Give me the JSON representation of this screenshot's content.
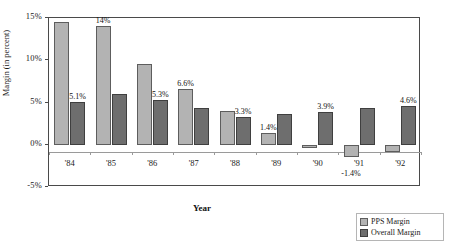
{
  "chart_data": {
    "type": "bar",
    "title": "",
    "xlabel": "Year",
    "ylabel": "Margin (in percent)",
    "categories": [
      "'84",
      "'85",
      "'86",
      "'87",
      "'88",
      "'89",
      "'90",
      "'91",
      "'92"
    ],
    "series": [
      {
        "name": "PPS Margin",
        "color": "#b3b3b3",
        "values": [
          14.5,
          14.0,
          9.6,
          6.6,
          4.0,
          1.4,
          -0.4,
          -1.4,
          -0.8
        ],
        "labels": [
          "",
          "14%",
          "",
          "6.6%",
          "",
          "1.4%",
          "",
          "-1.4%",
          ""
        ]
      },
      {
        "name": "Overall Margin",
        "color": "#6e6e6e",
        "values": [
          5.1,
          6.0,
          5.3,
          4.3,
          3.3,
          3.6,
          3.9,
          4.3,
          4.6
        ],
        "labels": [
          "5.1%",
          "",
          "5.3%",
          "",
          "3.3%",
          "",
          "3.9%",
          "",
          "4.6%"
        ]
      }
    ],
    "ylim": [
      -5,
      15
    ],
    "yticks": [
      15,
      10,
      5,
      0,
      -5
    ],
    "ytick_labels": [
      "15%",
      "10%",
      "5%",
      "0%",
      "-5%"
    ],
    "grid": false,
    "legend_position": "bottom-right"
  },
  "legend": {
    "items": [
      {
        "label": "PPS Margin"
      },
      {
        "label": "Overall Margin"
      }
    ]
  }
}
